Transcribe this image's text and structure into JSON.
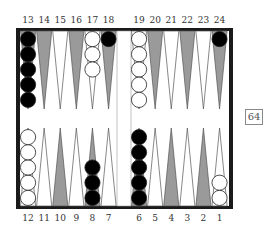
{
  "board": {
    "top_labels": [
      "13",
      "14",
      "15",
      "16",
      "17",
      "18",
      "19",
      "20",
      "21",
      "22",
      "23",
      "24"
    ],
    "bottom_labels": [
      "12",
      "11",
      "10",
      "9",
      "8",
      "7",
      "6",
      "5",
      "4",
      "3",
      "2",
      "1"
    ],
    "colors": {
      "frame": "#1a1a1a",
      "dark_point": "#9a9a9a",
      "light_point": "#ffffff",
      "point_outline": "#555555",
      "black_checker": "#000000",
      "white_checker": "#ffffff"
    },
    "positions": [
      {
        "point": 13,
        "color": "black",
        "count": 5
      },
      {
        "point": 17,
        "color": "white",
        "count": 3
      },
      {
        "point": 18,
        "color": "black",
        "count": 1
      },
      {
        "point": 19,
        "color": "white",
        "count": 5
      },
      {
        "point": 24,
        "color": "black",
        "count": 1
      },
      {
        "point": 12,
        "color": "white",
        "count": 5
      },
      {
        "point": 8,
        "color": "black",
        "count": 3
      },
      {
        "point": 6,
        "color": "black",
        "count": 5
      },
      {
        "point": 1,
        "color": "white",
        "count": 2
      }
    ]
  },
  "cube": {
    "value": "64"
  }
}
